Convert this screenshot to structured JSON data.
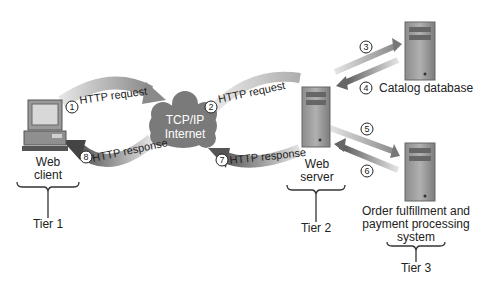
{
  "nodes": {
    "client": {
      "label_line1": "Web",
      "label_line2": "client",
      "tier": "Tier 1"
    },
    "internet": {
      "label_line1": "TCP/IP",
      "label_line2": "Internet"
    },
    "server": {
      "label_line1": "Web",
      "label_line2": "server",
      "tier": "Tier 2"
    },
    "catalog": {
      "label": "Catalog database"
    },
    "order": {
      "label_line1": "Order fulfillment and",
      "label_line2": "payment processing",
      "label_line3": "system",
      "tier": "Tier 3"
    }
  },
  "flows": [
    {
      "step": "1",
      "label": "HTTP request"
    },
    {
      "step": "2",
      "label": "HTTP request"
    },
    {
      "step": "3",
      "label": ""
    },
    {
      "step": "4",
      "label": ""
    },
    {
      "step": "5",
      "label": ""
    },
    {
      "step": "6",
      "label": ""
    },
    {
      "step": "7",
      "label": "HTTP response"
    },
    {
      "step": "8",
      "label": "HTTP response"
    }
  ],
  "colors": {
    "arrow_dark": "#6e6e6e",
    "arrow_light": "#d4d4d4",
    "cloud": "#7a7a7a",
    "device": "#9a9a9a"
  }
}
